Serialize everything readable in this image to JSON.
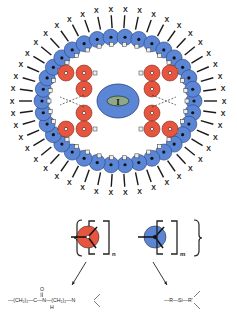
{
  "diagram": {
    "core": {
      "label": "I"
    },
    "terminal_group_label": "X",
    "repeat_units": [
      {
        "name": "hydrophilic-branch",
        "color": "#e8553f",
        "subscript": "n",
        "formula": {
          "left": "—(CH₂)₂—C—N—(CH₂)₂—N",
          "carbonyl_o": "O",
          "amide_h": "H"
        }
      },
      {
        "name": "hydrophobic-branch",
        "color": "#5b86d6",
        "subscript": "m",
        "formula": {
          "text": "—R—Si—R'"
        }
      }
    ],
    "colors": {
      "red_unit": "#e8553f",
      "blue_unit": "#5b86d6",
      "core_inner": "#8fa88a",
      "line": "#1a1a1a"
    }
  }
}
